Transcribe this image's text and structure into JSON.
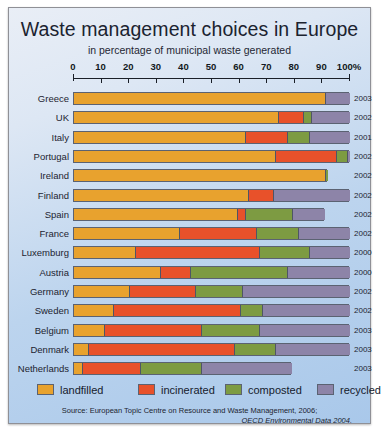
{
  "frame": {
    "title": "Waste management choices in Europe",
    "subtitle": "in percentage of municipal waste generated",
    "source_line1": "Source: European Topic Centre on Resource and Waste Management, 2006;",
    "source_line2": "OECD Environmental Data 2004."
  },
  "legend": [
    {
      "label": "landfilled",
      "color": "#E8A22E"
    },
    {
      "label": "incinerated",
      "color": "#E8512A"
    },
    {
      "label": "composted",
      "color": "#7D9B42"
    },
    {
      "label": "recycled",
      "color": "#8D84A8"
    }
  ],
  "chart_data": {
    "type": "bar",
    "orientation": "horizontal",
    "stacked": true,
    "title": "Waste management choices in Europe",
    "subtitle": "in percentage of municipal waste generated",
    "xlabel": "in percentage of municipal waste generated",
    "ylabel": "",
    "xlim": [
      0,
      100
    ],
    "xunit": "%",
    "xticks": [
      0,
      10,
      20,
      30,
      40,
      50,
      60,
      70,
      80,
      90,
      100
    ],
    "xtick_labels": [
      "0",
      "10",
      "20",
      "30",
      "40",
      "50",
      "60",
      "70",
      "80",
      "90",
      "100%"
    ],
    "grid": false,
    "legend_position": "bottom",
    "categories": [
      "Greece",
      "UK",
      "Italy",
      "Portugal",
      "Ireland",
      "Finland",
      "Spain",
      "France",
      "Luxemburg",
      "Austria",
      "Germany",
      "Sweden",
      "Belgium",
      "Denmark",
      "Netherlands"
    ],
    "series": [
      {
        "name": "landfilled",
        "color": "#E8A22E",
        "values": [
          91,
          74,
          62,
          73,
          91,
          63,
          59,
          38,
          22,
          31,
          20,
          14,
          11,
          5,
          3
        ]
      },
      {
        "name": "incinerated",
        "color": "#E8512A",
        "values": [
          0,
          9,
          15,
          22,
          0,
          9,
          3,
          28,
          45,
          11,
          24,
          46,
          35,
          53,
          21
        ]
      },
      {
        "name": "composted",
        "color": "#7D9B42",
        "values": [
          0,
          3,
          8,
          4,
          1,
          0,
          17,
          15,
          18,
          35,
          17,
          8,
          21,
          15,
          22
        ]
      },
      {
        "name": "recycled",
        "color": "#8D84A8",
        "values": [
          9,
          14,
          15,
          1,
          0,
          28,
          12,
          19,
          15,
          23,
          39,
          32,
          33,
          27,
          33
        ]
      }
    ],
    "rows": [
      {
        "country": "Greece",
        "year": "2003",
        "landfilled": 91,
        "incinerated": 0,
        "composted": 0,
        "recycled": 9,
        "total": 100
      },
      {
        "country": "UK",
        "year": "2002",
        "landfilled": 74,
        "incinerated": 9,
        "composted": 3,
        "recycled": 14,
        "total": 100
      },
      {
        "country": "Italy",
        "year": "2001",
        "landfilled": 62,
        "incinerated": 15,
        "composted": 8,
        "recycled": 15,
        "total": 100
      },
      {
        "country": "Portugal",
        "year": "2002",
        "landfilled": 73,
        "incinerated": 22,
        "composted": 4,
        "recycled": 1,
        "total": 100
      },
      {
        "country": "Ireland",
        "year": "2002",
        "landfilled": 91,
        "incinerated": 0,
        "composted": 1,
        "recycled": 0,
        "total": 92
      },
      {
        "country": "Finland",
        "year": "2002",
        "landfilled": 63,
        "incinerated": 9,
        "composted": 0,
        "recycled": 28,
        "total": 100
      },
      {
        "country": "Spain",
        "year": "2002",
        "landfilled": 59,
        "incinerated": 3,
        "composted": 17,
        "recycled": 12,
        "total": 91
      },
      {
        "country": "France",
        "year": "2002",
        "landfilled": 38,
        "incinerated": 28,
        "composted": 15,
        "recycled": 19,
        "total": 100
      },
      {
        "country": "Luxemburg",
        "year": "2000",
        "landfilled": 22,
        "incinerated": 45,
        "composted": 18,
        "recycled": 15,
        "total": 100
      },
      {
        "country": "Austria",
        "year": "2000",
        "landfilled": 31,
        "incinerated": 11,
        "composted": 35,
        "recycled": 23,
        "total": 100
      },
      {
        "country": "Germany",
        "year": "2002",
        "landfilled": 20,
        "incinerated": 24,
        "composted": 17,
        "recycled": 39,
        "total": 100
      },
      {
        "country": "Sweden",
        "year": "2002",
        "landfilled": 14,
        "incinerated": 46,
        "composted": 8,
        "recycled": 32,
        "total": 100
      },
      {
        "country": "Belgium",
        "year": "2003",
        "landfilled": 11,
        "incinerated": 35,
        "composted": 21,
        "recycled": 33,
        "total": 100
      },
      {
        "country": "Denmark",
        "year": "2003",
        "landfilled": 5,
        "incinerated": 53,
        "composted": 15,
        "recycled": 27,
        "total": 100
      },
      {
        "country": "Netherlands",
        "year": "2003",
        "landfilled": 3,
        "incinerated": 21,
        "composted": 22,
        "recycled": 33,
        "total": 79
      }
    ]
  }
}
